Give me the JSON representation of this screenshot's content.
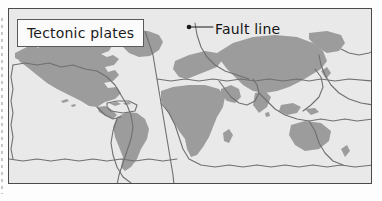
{
  "figure": {
    "kind": "world-map-diagram"
  },
  "title_box": {
    "label": "Tectonic plates",
    "border_color": "#5a5a5a",
    "fill_color": "#fbfbfb"
  },
  "annotations": {
    "fault": {
      "label": "Fault line",
      "marker": "leader-dot",
      "marker_color": "#1a1a1a",
      "leader_color": "#1a1a1a"
    }
  },
  "colors": {
    "land": "#9c9c9c",
    "ocean": "#e9e9e9",
    "plate_boundary": "#6f6f6f",
    "frame": "#4a4a4a",
    "page": "#fdfdfd",
    "text": "#1b1b1b"
  },
  "map_features": {
    "landmasses": [
      "North America",
      "Greenland",
      "South America",
      "Europe",
      "Africa",
      "Asia",
      "Australia",
      "Arabian Peninsula",
      "Madagascar",
      "Caribbean islands",
      "Hawaii",
      "Indonesia",
      "New Zealand",
      "Japan"
    ],
    "plate_boundaries": [
      "Mid-Atlantic Ridge",
      "Pacific plate boundary",
      "Nazca plate boundary",
      "Antarctic plate boundary",
      "Eurasian plate boundary",
      "African plate boundary",
      "Indo-Australian plate boundary",
      "North American plate boundary",
      "South American plate boundary",
      "Arabian plate boundary"
    ]
  }
}
